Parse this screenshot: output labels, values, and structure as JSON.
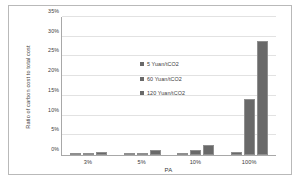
{
  "chart_data": {
    "type": "bar",
    "title": "",
    "xlabel": "PA",
    "ylabel": "Ratio of carbon cost to total cost",
    "categories": [
      "3%",
      "5%",
      "10%",
      "100%"
    ],
    "series": [
      {
        "name": "5 Yuan/tCO2",
        "values": [
          0.3,
          0.3,
          0.15,
          0.8
        ]
      },
      {
        "name": "60 Yuan/tCO2",
        "values": [
          0.5,
          0.6,
          1.2,
          14.2
        ]
      },
      {
        "name": "120 Yuan/tCO2",
        "values": [
          0.8,
          1.2,
          2.5,
          28.8
        ]
      }
    ],
    "ylim": [
      0,
      35
    ],
    "yticks": [
      "0%",
      "5%",
      "10%",
      "15%",
      "20%",
      "25%",
      "30%",
      "35%"
    ],
    "ytick_values": [
      0,
      5,
      10,
      15,
      20,
      25,
      30,
      35
    ],
    "grid": true,
    "legend_position": "inside-upper-left",
    "bar_color": "#696969",
    "grid_color": "#e2e2e2",
    "axis_color": "#a8a8a8",
    "text_color": "#3a3a3a"
  }
}
